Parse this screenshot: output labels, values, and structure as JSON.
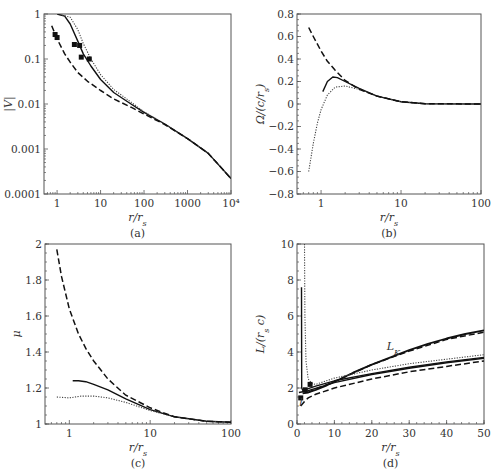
{
  "chart_data": [
    {
      "id": "a",
      "type": "line",
      "caption": "(a)",
      "xlabel": "r/r_s",
      "ylabel": "|V|",
      "xscale": "log",
      "yscale": "log",
      "xlim": [
        0.5,
        10000
      ],
      "ylim": [
        0.0001,
        1
      ],
      "xticks": [
        1,
        10,
        100,
        1000,
        10000
      ],
      "xtick_labels": [
        "1",
        "10",
        "100",
        "1000",
        "10⁴"
      ],
      "yticks": [
        0.0001,
        0.001,
        0.01,
        0.1,
        1
      ],
      "ytick_labels": [
        "0.0001",
        "0.001",
        "0.01",
        "0.1",
        "1"
      ],
      "series": [
        {
          "name": "solid",
          "style": "solid",
          "x": [
            1,
            1.5,
            2,
            3,
            4,
            6,
            10,
            20,
            50,
            100,
            300,
            1000,
            3000,
            10000
          ],
          "y": [
            1,
            0.9,
            0.6,
            0.25,
            0.13,
            0.07,
            0.035,
            0.018,
            0.01,
            0.0065,
            0.0036,
            0.0017,
            0.0008,
            0.00022
          ]
        },
        {
          "name": "dotted",
          "style": "dotted",
          "x": [
            1,
            2,
            3,
            4,
            6,
            10,
            20,
            50,
            100,
            300,
            1000,
            3000,
            10000
          ],
          "y": [
            1,
            0.85,
            0.45,
            0.22,
            0.1,
            0.045,
            0.021,
            0.011,
            0.0067,
            0.0036,
            0.0017,
            0.0008,
            0.00022
          ]
        },
        {
          "name": "dashed",
          "style": "dashed",
          "x": [
            0.75,
            1,
            1.5,
            2,
            3,
            5,
            10,
            20,
            50,
            100,
            300,
            1000,
            3000,
            10000
          ],
          "y": [
            0.55,
            0.28,
            0.13,
            0.085,
            0.05,
            0.032,
            0.02,
            0.013,
            0.0085,
            0.006,
            0.0035,
            0.0017,
            0.0008,
            0.00022
          ]
        }
      ],
      "markers": [
        {
          "x": 0.9,
          "y": 0.35
        },
        {
          "x": 1.0,
          "y": 0.3
        },
        {
          "x": 2.5,
          "y": 0.21
        },
        {
          "x": 3.3,
          "y": 0.2
        },
        {
          "x": 3.6,
          "y": 0.11
        },
        {
          "x": 5.5,
          "y": 0.1
        }
      ]
    },
    {
      "id": "b",
      "type": "line",
      "caption": "(b)",
      "xlabel": "r/r_s",
      "ylabel": "Ω/(c/r_s)",
      "xscale": "log",
      "yscale": "linear",
      "xlim": [
        0.5,
        100
      ],
      "ylim": [
        -0.8,
        0.8
      ],
      "xticks": [
        1,
        10,
        100
      ],
      "xtick_labels": [
        "1",
        "10",
        "100"
      ],
      "yticks": [
        -0.8,
        -0.6,
        -0.4,
        -0.2,
        0,
        0.2,
        0.4,
        0.6,
        0.8
      ],
      "ytick_labels": [
        "−0.8",
        "−0.6",
        "−0.4",
        "−0.2",
        "0",
        "0.2",
        "0.4",
        "0.6",
        "0.8"
      ],
      "series": [
        {
          "name": "solid",
          "style": "solid",
          "x": [
            1.05,
            1.2,
            1.4,
            1.6,
            2,
            3,
            5,
            10,
            20,
            100
          ],
          "y": [
            0.11,
            0.2,
            0.24,
            0.235,
            0.2,
            0.14,
            0.07,
            0.02,
            0.003,
            0
          ]
        },
        {
          "name": "dotted",
          "style": "dotted",
          "x": [
            0.7,
            0.8,
            0.9,
            1.0,
            1.2,
            1.5,
            2,
            3,
            5,
            10,
            20,
            100
          ],
          "y": [
            -0.6,
            -0.35,
            -0.17,
            -0.05,
            0.08,
            0.15,
            0.16,
            0.13,
            0.07,
            0.02,
            0.003,
            0
          ]
        },
        {
          "name": "dashed",
          "style": "dashed",
          "x": [
            0.7,
            0.8,
            1.0,
            1.2,
            1.5,
            2,
            3,
            5,
            10,
            20,
            100
          ],
          "y": [
            0.68,
            0.6,
            0.47,
            0.38,
            0.3,
            0.21,
            0.13,
            0.07,
            0.02,
            0.003,
            0
          ]
        }
      ]
    },
    {
      "id": "c",
      "type": "line",
      "caption": "(c)",
      "xlabel": "r/r_s",
      "ylabel": "μ",
      "xscale": "log",
      "yscale": "linear",
      "xlim": [
        0.5,
        100
      ],
      "ylim": [
        1,
        2
      ],
      "xticks": [
        1,
        10,
        100
      ],
      "xtick_labels": [
        "1",
        "10",
        "100"
      ],
      "yticks": [
        1,
        1.2,
        1.4,
        1.6,
        1.8,
        2
      ],
      "ytick_labels": [
        "1",
        "1.2",
        "1.4",
        "1.6",
        "1.8",
        "2"
      ],
      "series": [
        {
          "name": "solid",
          "style": "solid",
          "x": [
            1.1,
            1.3,
            1.6,
            2,
            3,
            5,
            10,
            20,
            50,
            100
          ],
          "y": [
            1.24,
            1.24,
            1.235,
            1.22,
            1.19,
            1.14,
            1.08,
            1.04,
            1.015,
            1.01
          ]
        },
        {
          "name": "dotted",
          "style": "dotted",
          "x": [
            0.7,
            1.0,
            1.4,
            2,
            3,
            5,
            10,
            20,
            50,
            100
          ],
          "y": [
            1.15,
            1.145,
            1.155,
            1.155,
            1.145,
            1.12,
            1.075,
            1.04,
            1.015,
            1.01
          ]
        },
        {
          "name": "dashed",
          "style": "dashed",
          "x": [
            0.7,
            0.8,
            1.0,
            1.3,
            1.6,
            2,
            3,
            5,
            10,
            15,
            20,
            50,
            100
          ],
          "y": [
            1.97,
            1.82,
            1.64,
            1.5,
            1.42,
            1.35,
            1.25,
            1.16,
            1.09,
            1.06,
            1.04,
            1.015,
            1.01
          ]
        }
      ]
    },
    {
      "id": "d",
      "type": "line",
      "caption": "(d)",
      "xlabel": "r/r_s",
      "ylabel": "L/(r_s c)",
      "xscale": "linear",
      "yscale": "linear",
      "xlim": [
        0,
        50
      ],
      "ylim": [
        0,
        10
      ],
      "xticks": [
        0,
        10,
        20,
        30,
        40,
        50
      ],
      "xtick_labels": [
        "0",
        "10",
        "20",
        "30",
        "40",
        "50"
      ],
      "yticks": [
        0,
        2,
        4,
        6,
        8,
        10
      ],
      "ytick_labels": [
        "0",
        "2",
        "4",
        "6",
        "8",
        "10"
      ],
      "annotations": [
        {
          "text": "L_K",
          "x": 24,
          "y": 4.1
        },
        {
          "text": "l",
          "x": 0.6,
          "y": 1.0
        }
      ],
      "series": [
        {
          "name": "L_K",
          "style": "solid-thick",
          "x": [
            1.5,
            3,
            5,
            8,
            10,
            15,
            20,
            25,
            30,
            35,
            40,
            45,
            50
          ],
          "y": [
            1.7,
            1.75,
            1.9,
            2.15,
            2.35,
            2.85,
            3.3,
            3.7,
            4.1,
            4.45,
            4.75,
            5.0,
            5.2
          ]
        },
        {
          "name": "L_K dashed",
          "style": "dashed",
          "x": [
            3,
            5,
            10,
            20,
            30,
            40,
            50
          ],
          "y": [
            1.75,
            1.95,
            2.35,
            3.3,
            4.05,
            4.7,
            5.1
          ]
        },
        {
          "name": "solid",
          "style": "solid",
          "x": [
            1.2,
            1.25,
            1.6,
            2,
            5,
            10,
            20,
            30,
            40,
            50
          ],
          "y": [
            7.6,
            2.0,
            1.85,
            1.9,
            2.1,
            2.4,
            2.8,
            3.15,
            3.45,
            3.7
          ]
        },
        {
          "name": "solid-low",
          "style": "solid",
          "x": [
            0.5,
            3,
            10,
            20,
            30,
            40,
            50
          ],
          "y": [
            1.75,
            1.85,
            2.3,
            2.75,
            3.1,
            3.4,
            3.65
          ]
        },
        {
          "name": "dotted",
          "style": "dotted",
          "x": [
            2,
            2.1,
            2.4,
            3,
            4,
            5,
            10,
            20,
            30,
            40,
            50
          ],
          "y": [
            10,
            6,
            3.5,
            2.5,
            2.25,
            2.2,
            2.55,
            3.0,
            3.35,
            3.6,
            3.85
          ]
        },
        {
          "name": "dashed",
          "style": "dashed",
          "x": [
            1,
            2,
            3,
            5,
            10,
            20,
            30,
            40,
            50
          ],
          "y": [
            1.0,
            1.25,
            1.45,
            1.65,
            2.0,
            2.5,
            2.9,
            3.2,
            3.5
          ]
        }
      ],
      "markers": [
        {
          "x": 1.0,
          "y": 1.45
        },
        {
          "x": 2.2,
          "y": 1.9
        },
        {
          "x": 3.5,
          "y": 2.2
        }
      ]
    }
  ],
  "panels_layout": {
    "a": {
      "left": 44,
      "right": 231,
      "top": 14,
      "bottom": 194
    },
    "b": {
      "left": 297,
      "right": 481,
      "top": 14,
      "bottom": 194
    },
    "c": {
      "left": 45,
      "right": 231,
      "top": 244,
      "bottom": 424
    },
    "d": {
      "left": 297,
      "right": 484,
      "top": 244,
      "bottom": 424
    }
  }
}
